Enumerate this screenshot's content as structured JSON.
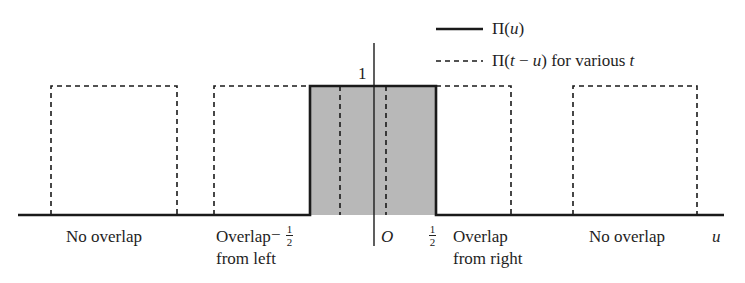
{
  "legend": {
    "solid_label": "Π(u)",
    "solid_label_pre": "Π(",
    "solid_label_var": "u",
    "solid_label_post": ")",
    "dashed_label_pre": "Π(",
    "dashed_label_t": "t",
    "dashed_label_minus": " − ",
    "dashed_label_u": "u",
    "dashed_label_mid": ") for various ",
    "dashed_label_t2": "t"
  },
  "axis": {
    "height_label": "1",
    "origin_label": "O",
    "x_var": "u",
    "neg_sign": "−",
    "half_num": "1",
    "half_den": "2"
  },
  "regions": {
    "no_overlap_left": "No overlap",
    "overlap_left_line1": "Overlap",
    "overlap_left_line2": "from left",
    "overlap_right_line1": "Overlap",
    "overlap_right_line2": "from right",
    "no_overlap_right": "No overlap"
  },
  "colors": {
    "shade": "#b8b8b8",
    "line": "#1a1a1a"
  }
}
